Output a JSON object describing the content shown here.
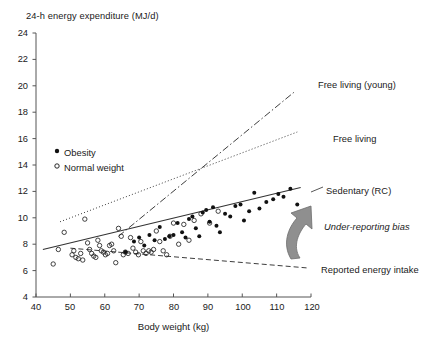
{
  "chart_data": {
    "type": "scatter",
    "title": "24-h energy expenditure (MJ/d)",
    "xlabel": "Body weight (kg)",
    "ylabel": "24-h energy expenditure (MJ/d)",
    "xlim": [
      40,
      120
    ],
    "ylim": [
      4,
      24
    ],
    "xticks": [
      40,
      50,
      60,
      70,
      80,
      90,
      100,
      110,
      120
    ],
    "yticks": [
      4,
      6,
      8,
      10,
      12,
      14,
      16,
      18,
      20,
      22,
      24
    ],
    "grid": false,
    "legend_position": "upper-left-inside",
    "legend": [
      {
        "label": "Obesity",
        "marker": "filled-circle",
        "color": "#111111"
      },
      {
        "label": "Normal weight",
        "marker": "open-circle",
        "color": "#111111"
      }
    ],
    "series": [
      {
        "name": "Normal weight",
        "marker": "open-circle",
        "color": "#222222",
        "points": [
          [
            45.0,
            6.5
          ],
          [
            46.5,
            7.6
          ],
          [
            48.2,
            8.9
          ],
          [
            50.5,
            7.2
          ],
          [
            51.0,
            7.5
          ],
          [
            51.6,
            7.0
          ],
          [
            52.3,
            6.9
          ],
          [
            53.0,
            7.3
          ],
          [
            53.6,
            6.8
          ],
          [
            54.2,
            9.9
          ],
          [
            55.0,
            8.1
          ],
          [
            55.6,
            7.6
          ],
          [
            56.2,
            7.3
          ],
          [
            56.8,
            7.1
          ],
          [
            57.4,
            7.0
          ],
          [
            58.0,
            8.3
          ],
          [
            58.5,
            7.9
          ],
          [
            59.0,
            7.5
          ],
          [
            59.6,
            7.4
          ],
          [
            60.2,
            7.2
          ],
          [
            60.8,
            7.3
          ],
          [
            61.4,
            7.9
          ],
          [
            62.0,
            8.0
          ],
          [
            62.6,
            7.5
          ],
          [
            63.2,
            6.6
          ],
          [
            64.0,
            9.2
          ],
          [
            64.8,
            8.6
          ],
          [
            65.4,
            7.2
          ],
          [
            66.0,
            7.4
          ],
          [
            66.8,
            7.3
          ],
          [
            67.5,
            8.5
          ],
          [
            68.2,
            7.7
          ],
          [
            69.0,
            7.4
          ],
          [
            69.8,
            7.2
          ],
          [
            70.5,
            8.2
          ],
          [
            71.2,
            7.5
          ],
          [
            72.0,
            7.3
          ],
          [
            72.8,
            7.5
          ],
          [
            73.5,
            7.4
          ],
          [
            74.2,
            7.6
          ],
          [
            75.0,
            9.0
          ],
          [
            76.0,
            8.2
          ],
          [
            77.0,
            7.5
          ],
          [
            78.0,
            7.2
          ],
          [
            79.0,
            8.6
          ],
          [
            80.0,
            9.6
          ],
          [
            81.5,
            8.0
          ],
          [
            83.0,
            9.5
          ],
          [
            84.5,
            8.3
          ],
          [
            86.0,
            9.8
          ],
          [
            88.0,
            10.3
          ],
          [
            90.5,
            9.6
          ],
          [
            93.0,
            10.5
          ]
        ]
      },
      {
        "name": "Obesity",
        "marker": "filled-circle",
        "color": "#111111",
        "points": [
          [
            66.0,
            7.4
          ],
          [
            68.5,
            8.2
          ],
          [
            70.0,
            8.5
          ],
          [
            71.5,
            7.9
          ],
          [
            73.0,
            8.7
          ],
          [
            74.5,
            8.3
          ],
          [
            76.0,
            9.3
          ],
          [
            77.5,
            8.4
          ],
          [
            78.8,
            8.6
          ],
          [
            80.0,
            8.7
          ],
          [
            81.2,
            9.6
          ],
          [
            82.5,
            8.9
          ],
          [
            83.5,
            8.5
          ],
          [
            84.5,
            9.9
          ],
          [
            85.5,
            10.1
          ],
          [
            86.5,
            9.2
          ],
          [
            87.5,
            8.6
          ],
          [
            88.5,
            10.4
          ],
          [
            89.5,
            10.6
          ],
          [
            90.5,
            9.7
          ],
          [
            91.5,
            10.8
          ],
          [
            92.5,
            9.4
          ],
          [
            93.5,
            8.9
          ],
          [
            95.0,
            10.3
          ],
          [
            96.5,
            10.1
          ],
          [
            98.0,
            10.9
          ],
          [
            99.5,
            11.0
          ],
          [
            100.5,
            9.8
          ],
          [
            102.0,
            10.5
          ],
          [
            103.5,
            11.9
          ],
          [
            105.0,
            10.7
          ],
          [
            107.0,
            11.2
          ],
          [
            109.0,
            11.4
          ],
          [
            110.5,
            11.8
          ],
          [
            112.0,
            11.6
          ],
          [
            114.0,
            12.2
          ],
          [
            116.0,
            11.0
          ]
        ]
      }
    ],
    "lines": [
      {
        "name": "Free living (young)",
        "style": "dash-dot",
        "label": "Free living (young)",
        "x0": 64,
        "y0": 8.6,
        "x1": 115,
        "y1": 19.5
      },
      {
        "name": "Free living",
        "style": "dotted",
        "label": "Free living",
        "x0": 47,
        "y0": 9.7,
        "x1": 116,
        "y1": 16.5
      },
      {
        "name": "Sedentary (RC)",
        "style": "solid",
        "label": "Sedentary (RC)",
        "x0": 42,
        "y0": 7.6,
        "x1": 117,
        "y1": 12.3
      },
      {
        "name": "Reported energy intake",
        "style": "dashed",
        "label": "Reported energy intake",
        "x0": 50,
        "y0": 7.7,
        "x1": 119,
        "y1": 6.2
      }
    ],
    "annotations": [
      {
        "text": "Free living (young)",
        "style": "normal",
        "x_px": 318,
        "y_px": 80
      },
      {
        "text": "Free living",
        "style": "normal",
        "x_px": 333,
        "y_px": 134
      },
      {
        "text": "Sedentary (RC)",
        "style": "normal",
        "x_px": 326,
        "y_px": 186
      },
      {
        "text": "Under-reporting bias",
        "style": "italic",
        "x_px": 324,
        "y_px": 222
      },
      {
        "text": "Reported energy intake",
        "style": "normal",
        "x_px": 321,
        "y_px": 265
      }
    ],
    "arrow": {
      "name": "under-reporting-bias-arrow",
      "color": "#8c8c8c",
      "direction": "curved-up-left"
    }
  }
}
